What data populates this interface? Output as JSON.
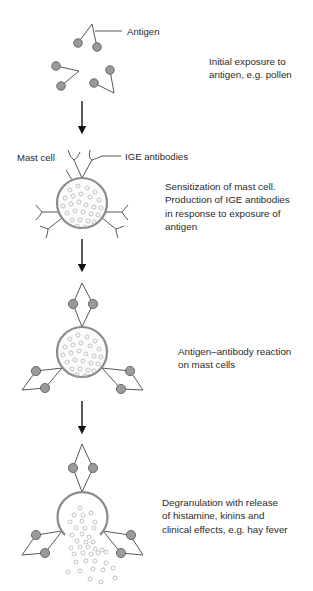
{
  "labels": {
    "antigen": "Antigen",
    "mast_cell": "Mast cell",
    "ige_antibodies": "IGE antibodies"
  },
  "steps": [
    {
      "lines": [
        "Initial exposure to",
        "antigen, e.g. pollen"
      ]
    },
    {
      "lines": [
        "Sensitization of mast cell.",
        "Production of IGE antibodies",
        "in response to exposure of",
        "antigen"
      ]
    },
    {
      "lines": [
        "Antigen–antibody reaction",
        "on mast cells"
      ]
    },
    {
      "lines": [
        "Degranulation with release",
        "of histamine, kinins and",
        "clinical effects, e.g. hay fever"
      ]
    }
  ],
  "colors": {
    "antigen_ball": "#9a9a9a",
    "granule": "#c8c8c8",
    "cell_membrane": "#8a8a8a",
    "line": "#444444"
  }
}
